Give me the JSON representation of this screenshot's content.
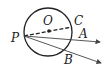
{
  "diagram": {
    "type": "geometry",
    "labels": {
      "O": "O",
      "C": "C",
      "P": "P",
      "A": "A",
      "B": "B"
    },
    "colors": {
      "stroke": "#222222",
      "background": "#ffffff"
    }
  }
}
